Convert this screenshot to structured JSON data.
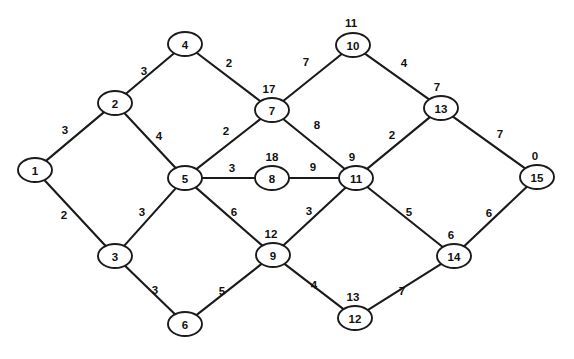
{
  "chart_data": {
    "type": "diagram",
    "title": "",
    "subtitle": "",
    "graph_kind": "undirected-weighted-graph",
    "layout": "diamond-lattice",
    "background_color": "#ffffff",
    "stroke_color": "#1a1a1a",
    "node_fill_color": "#ffffff",
    "node_shape": "ellipse",
    "node_rx": 17,
    "node_ry": 12,
    "nodes": [
      {
        "id": "1",
        "label": "1",
        "x": 35,
        "y": 170,
        "cost_label": "",
        "cost_dx": 0,
        "cost_dy": -20
      },
      {
        "id": "2",
        "label": "2",
        "x": 115,
        "y": 103,
        "cost_label": "",
        "cost_dx": 0,
        "cost_dy": -20
      },
      {
        "id": "3",
        "label": "3",
        "x": 115,
        "y": 256,
        "cost_label": "",
        "cost_dx": 0,
        "cost_dy": -20
      },
      {
        "id": "4",
        "label": "4",
        "x": 185,
        "y": 44,
        "cost_label": "",
        "cost_dx": 0,
        "cost_dy": -20
      },
      {
        "id": "5",
        "label": "5",
        "x": 185,
        "y": 178,
        "cost_label": "",
        "cost_dx": 0,
        "cost_dy": -20
      },
      {
        "id": "6",
        "label": "6",
        "x": 185,
        "y": 324,
        "cost_label": "",
        "cost_dx": 0,
        "cost_dy": -20
      },
      {
        "id": "7",
        "label": "7",
        "x": 272,
        "y": 110,
        "cost_label": "17",
        "cost_dx": -3,
        "cost_dy": -21
      },
      {
        "id": "8",
        "label": "8",
        "x": 272,
        "y": 178,
        "cost_label": "18",
        "cost_dx": 0,
        "cost_dy": -21
      },
      {
        "id": "9",
        "label": "9",
        "x": 273,
        "y": 255,
        "cost_label": "12",
        "cost_dx": -2,
        "cost_dy": -21
      },
      {
        "id": "10",
        "label": "10",
        "x": 353,
        "y": 45,
        "cost_label": "11",
        "cost_dx": -2,
        "cost_dy": -22
      },
      {
        "id": "11",
        "label": "11",
        "x": 356,
        "y": 178,
        "cost_label": "9",
        "cost_dx": -4,
        "cost_dy": -21
      },
      {
        "id": "12",
        "label": "12",
        "x": 355,
        "y": 318,
        "cost_label": "13",
        "cost_dx": -2,
        "cost_dy": -21
      },
      {
        "id": "13",
        "label": "13",
        "x": 441,
        "y": 108,
        "cost_label": "7",
        "cost_dx": -4,
        "cost_dy": -21
      },
      {
        "id": "14",
        "label": "14",
        "x": 454,
        "y": 256,
        "cost_label": "6",
        "cost_dx": -3,
        "cost_dy": -21
      },
      {
        "id": "15",
        "label": "15",
        "x": 537,
        "y": 177,
        "cost_label": "0",
        "cost_dx": -2,
        "cost_dy": -21
      }
    ],
    "edges": [
      {
        "source": "1",
        "target": "2",
        "weight": "3",
        "lx": 65,
        "ly": 130
      },
      {
        "source": "1",
        "target": "3",
        "weight": "2",
        "lx": 64,
        "ly": 215
      },
      {
        "source": "2",
        "target": "4",
        "weight": "3",
        "lx": 144,
        "ly": 71
      },
      {
        "source": "2",
        "target": "5",
        "weight": "4",
        "lx": 159,
        "ly": 136
      },
      {
        "source": "3",
        "target": "5",
        "weight": "3",
        "lx": 142,
        "ly": 212
      },
      {
        "source": "3",
        "target": "6",
        "weight": "3",
        "lx": 155,
        "ly": 290
      },
      {
        "source": "4",
        "target": "7",
        "weight": "2",
        "lx": 229,
        "ly": 63
      },
      {
        "source": "5",
        "target": "7",
        "weight": "2",
        "lx": 226,
        "ly": 131
      },
      {
        "source": "5",
        "target": "8",
        "weight": "3",
        "lx": 232,
        "ly": 168
      },
      {
        "source": "5",
        "target": "9",
        "weight": "6",
        "lx": 234,
        "ly": 212
      },
      {
        "source": "6",
        "target": "9",
        "weight": "5",
        "lx": 222,
        "ly": 291
      },
      {
        "source": "7",
        "target": "10",
        "weight": "7",
        "lx": 306,
        "ly": 62
      },
      {
        "source": "7",
        "target": "11",
        "weight": "8",
        "lx": 317,
        "ly": 125
      },
      {
        "source": "8",
        "target": "11",
        "weight": "9",
        "lx": 313,
        "ly": 167
      },
      {
        "source": "9",
        "target": "11",
        "weight": "3",
        "lx": 309,
        "ly": 211
      },
      {
        "source": "9",
        "target": "12",
        "weight": "4",
        "lx": 314,
        "ly": 285
      },
      {
        "source": "10",
        "target": "13",
        "weight": "4",
        "lx": 404,
        "ly": 63
      },
      {
        "source": "11",
        "target": "13",
        "weight": "2",
        "lx": 392,
        "ly": 135
      },
      {
        "source": "11",
        "target": "14",
        "weight": "5",
        "lx": 409,
        "ly": 212
      },
      {
        "source": "12",
        "target": "14",
        "weight": "7",
        "lx": 402,
        "ly": 291
      },
      {
        "source": "13",
        "target": "15",
        "weight": "7",
        "lx": 500,
        "ly": 134
      },
      {
        "source": "14",
        "target": "15",
        "weight": "6",
        "lx": 489,
        "ly": 213
      }
    ]
  }
}
